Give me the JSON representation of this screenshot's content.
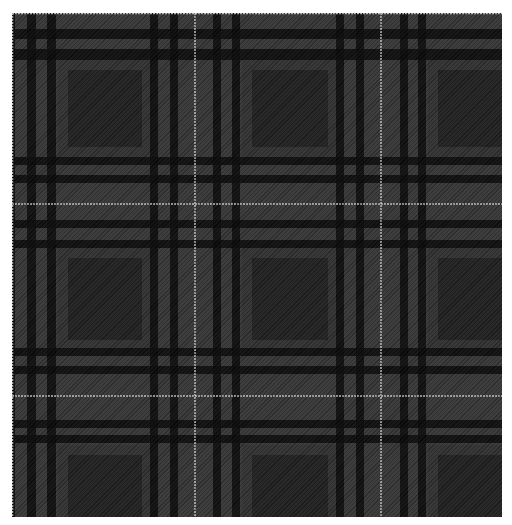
{
  "image": {
    "subject": "grey and black tartan plaid fabric swatch",
    "canvas": {
      "width": 512,
      "height": 525,
      "background": "#ffffff"
    },
    "swatch": {
      "x": 12,
      "y": 13,
      "width": 490,
      "height": 504
    }
  },
  "colors": {
    "base_grey": "#383838",
    "border_grey": "#333333",
    "dark_square": "#222222",
    "black_stripe": "#0a0a0a",
    "white_thread": "#d8d8d8"
  },
  "stripes": {
    "vertical": [
      {
        "x": 0,
        "w": 3,
        "color": "black_stripe"
      },
      {
        "x": 15,
        "w": 9,
        "color": "black_stripe"
      },
      {
        "x": 35,
        "w": 9,
        "color": "black_stripe"
      },
      {
        "x": 138,
        "w": 8,
        "color": "black_stripe"
      },
      {
        "x": 158,
        "w": 8,
        "color": "black_stripe"
      },
      {
        "x": 182,
        "w": 2,
        "color": "white_thread"
      },
      {
        "x": 201,
        "w": 8,
        "color": "black_stripe"
      },
      {
        "x": 220,
        "w": 8,
        "color": "black_stripe"
      },
      {
        "x": 324,
        "w": 8,
        "color": "black_stripe"
      },
      {
        "x": 344,
        "w": 8,
        "color": "black_stripe"
      },
      {
        "x": 368,
        "w": 2,
        "color": "white_thread"
      },
      {
        "x": 388,
        "w": 8,
        "color": "black_stripe"
      },
      {
        "x": 406,
        "w": 8,
        "color": "black_stripe"
      }
    ],
    "horizontal": [
      {
        "y": 16,
        "h": 10,
        "color": "black_stripe"
      },
      {
        "y": 36,
        "h": 11,
        "color": "black_stripe"
      },
      {
        "y": 144,
        "h": 8,
        "color": "black_stripe"
      },
      {
        "y": 162,
        "h": 8,
        "color": "black_stripe"
      },
      {
        "y": 190,
        "h": 2,
        "color": "white_thread"
      },
      {
        "y": 207,
        "h": 8,
        "color": "black_stripe"
      },
      {
        "y": 227,
        "h": 8,
        "color": "black_stripe"
      },
      {
        "y": 335,
        "h": 8,
        "color": "black_stripe"
      },
      {
        "y": 353,
        "h": 8,
        "color": "black_stripe"
      },
      {
        "y": 382,
        "h": 2,
        "color": "white_thread"
      },
      {
        "y": 407,
        "h": 8,
        "color": "black_stripe"
      },
      {
        "y": 422,
        "h": 8,
        "color": "black_stripe"
      }
    ],
    "dark_squares": [
      {
        "x": 56,
        "y": 57,
        "w": 74,
        "h": 77
      },
      {
        "x": 240,
        "y": 57,
        "w": 76,
        "h": 77
      },
      {
        "x": 426,
        "y": 57,
        "w": 64,
        "h": 77
      },
      {
        "x": 56,
        "y": 245,
        "w": 74,
        "h": 82
      },
      {
        "x": 240,
        "y": 245,
        "w": 76,
        "h": 82
      },
      {
        "x": 426,
        "y": 245,
        "w": 64,
        "h": 82
      },
      {
        "x": 56,
        "y": 442,
        "w": 74,
        "h": 62
      },
      {
        "x": 240,
        "y": 442,
        "w": 76,
        "h": 62
      },
      {
        "x": 426,
        "y": 442,
        "w": 64,
        "h": 62
      }
    ],
    "border_pad": 10
  }
}
